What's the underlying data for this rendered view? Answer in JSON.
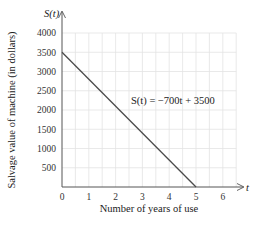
{
  "chart_data": {
    "type": "line",
    "title": "",
    "xlabel": "Number of years of use",
    "ylabel": "Salvage value of machine (in dollars)",
    "x_axis_name": "t",
    "y_axis_name": "S(t)",
    "xlim": [
      0,
      6.5
    ],
    "ylim": [
      0,
      4000
    ],
    "x_ticks": [
      0,
      1,
      2,
      3,
      4,
      5,
      6
    ],
    "y_ticks": [
      500,
      1000,
      1500,
      2000,
      2500,
      3000,
      3500,
      4000
    ],
    "grid": true,
    "grid_x_step": 0.5,
    "grid_y_step": 500,
    "series": [
      {
        "name": "S(t) = −700t + 3500",
        "x": [
          0,
          5
        ],
        "values": [
          3500,
          0
        ]
      }
    ],
    "annotations": [
      {
        "text": "S(t) = −700t + 3500",
        "x": 2.6,
        "y": 2150
      }
    ],
    "colors": {
      "line": "#4a4a4a",
      "grid": "#e3e3e3",
      "axis": "#555555"
    }
  }
}
